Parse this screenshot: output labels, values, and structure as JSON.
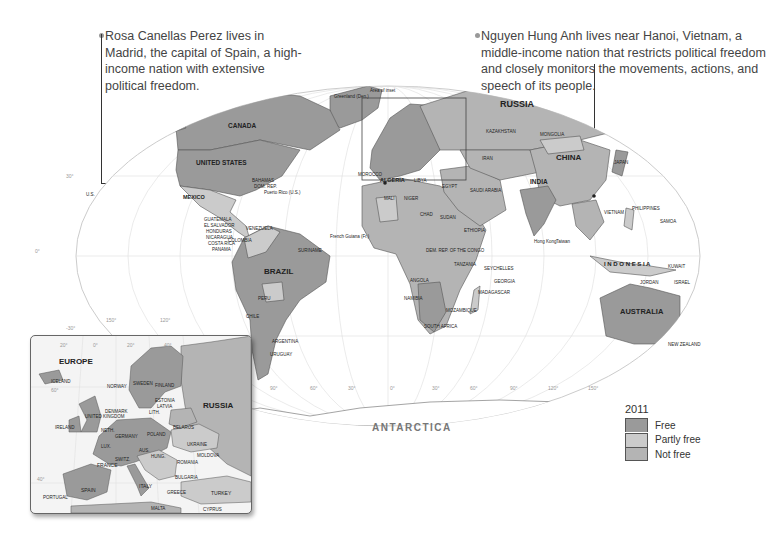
{
  "callouts": {
    "left": {
      "text": "Rosa Canellas Perez lives in Madrid, the capital of Spain, a high-income nation with extensive political freedom."
    },
    "right": {
      "text": "Nguyen Hung Anh lives near Hanoi, Vietnam, a middle-income nation that restricts political freedom and closely monitors the movements, actions, and speech of its people."
    }
  },
  "map": {
    "inset_area_label": "Area of inset",
    "continent_labels": {
      "antarctica": "ANTARCTICA"
    },
    "major_country_labels": {
      "canada": "CANADA",
      "united_states": "UNITED STATES",
      "russia": "RUSSIA",
      "china": "CHINA",
      "brazil": "BRAZIL",
      "australia": "AUSTRALIA",
      "india": "INDIA",
      "algeria": "ALGERIA",
      "mexico": "MEXICO",
      "argentina": "ARGENTINA",
      "mongolia": "MONGOLIA",
      "kazakhstan": "KAZAKHSTAN",
      "sudan": "SUDAN",
      "libya": "LIBYA",
      "egypt": "EGYPT",
      "chad": "CHAD",
      "niger": "NIGER",
      "mali": "MALI",
      "angola": "ANGOLA",
      "namibia": "NAMIBIA",
      "saudi_arabia": "SAUDI ARABIA",
      "iran": "IRAN",
      "indonesia": "I N D O N E S I A",
      "peru": "PERU",
      "bolivia": "BOLIVIA",
      "chile": "CHILE",
      "colombia": "COLOMBIA",
      "venezuela": "VENEZUELA",
      "madagascar": "MADAGASCAR",
      "philippines": "PHILIPPINES",
      "new_zealand": "NEW ZEALAND",
      "greenland": "Greenland (Den.)",
      "morocco": "MOROCCO",
      "ethiopia": "ETHIOPIA",
      "tanzania": "TANZANIA",
      "south_africa": "SOUTH AFRICA",
      "mozambique": "MOZAMBIQUE",
      "dem_rep_congo": "DEM. REP. OF THE CONGO",
      "japan": "JAPAN",
      "vietnam": "VIETNAM"
    },
    "small_labels": [
      "U.S.",
      "BAHAMAS",
      "DOM. REP.",
      "Puerto Rico (U.S.)",
      "CUBA",
      "BELIZE",
      "JAMAICA",
      "HAITI",
      "ST. KITTS & NEVIS",
      "ANTIGUA & BARBUDA",
      "DOMINICA",
      "ST. LUCIA",
      "BARBADOS",
      "ST. VINCENT & THE GRENADINES",
      "GRENADA",
      "TRINIDAD & TOBAGO",
      "GUYANA",
      "SURINAME",
      "French Guiana (Fr.)",
      "GUATEMALA",
      "EL SALVADOR",
      "HONDURAS",
      "NICARAGUA",
      "COSTA RICA",
      "PANAMA",
      "ECUADOR",
      "PARAGUAY",
      "URUGUAY",
      "Western Sahara (Mor.)",
      "MAURITANIA",
      "CAPE VERDE",
      "SENEGAL",
      "GAMBIA",
      "GUINEA-BISSAU",
      "GUINEA",
      "SIERRA LEONE",
      "LIBERIA",
      "COTE D'IVOIRE",
      "TOGO",
      "EQ. GUINEA",
      "SAO TOME & PRINCIPE",
      "REP. OF THE CONGO",
      "GHANA",
      "NIGERIA",
      "CAMEROON",
      "GABON",
      "C.A.R.",
      "ERITREA",
      "DJIBOUTI",
      "SOMALIA",
      "YEMEN",
      "OMAN",
      "UGANDA",
      "KENYA",
      "RWANDA",
      "BURUNDI",
      "MALAWI",
      "ZAMBIA",
      "ZIMBABWE",
      "BOTSWANA",
      "SWAZILAND",
      "LESOTHO",
      "COMOROS",
      "SEYCHELLES",
      "MAURITIUS",
      "GEORGIA",
      "ARMENIA",
      "AZERBAIJAN",
      "UZBEKISTAN",
      "TURKMENISTAN",
      "KYRGYZSTAN",
      "TAJIKISTAN",
      "AFGHANISTAN",
      "PAKISTAN",
      "NEPAL",
      "BHUTAN",
      "BANGLADESH",
      "MYANMAR",
      "LAOS",
      "THAILAND",
      "CAMBODIA",
      "MALAYSIA",
      "BRUNEI",
      "Singapore",
      "SRI LANKA",
      "MALDIVES",
      "NORTH KOREA",
      "SOUTH KOREA",
      "Taiwan",
      "Hong Kong",
      "Macau",
      "PALAU",
      "FEDERATED STATES OF MICRONESIA",
      "MARSHALL ISLANDS",
      "NAURU",
      "KIRIBATI",
      "TUVALU",
      "SOLOMON ISLANDS",
      "PAPUA NEW GUINEA",
      "TIMOR-LESTE",
      "VANUATU",
      "FIJI",
      "New Caledonia (Fr.)",
      "SAMOA",
      "TONGA",
      "IRAQ",
      "KUWAIT",
      "BAHRAIN",
      "QATAR",
      "U.A.E.",
      "JORDAN",
      "ISRAEL",
      "LEBANON",
      "SYRIA",
      "TUNISIA",
      "CYPRUS"
    ],
    "graticule": {
      "latitudes": [
        "30°",
        "0°",
        "-30°"
      ],
      "longitudes": [
        "150°",
        "120°",
        "90°",
        "60°",
        "30°",
        "0°",
        "30°",
        "60°",
        "90°",
        "120°",
        "150°"
      ]
    }
  },
  "inset": {
    "title": "EUROPE",
    "labels": {
      "russia": "RUSSIA",
      "iceland": "ICELAND",
      "norway": "NORWAY",
      "sweden": "SWEDEN",
      "finland": "FINLAND",
      "estonia": "ESTONIA",
      "latvia": "LATVIA",
      "lithuania": "LITH.",
      "denmark": "DENMARK",
      "united_kingdom": "UNITED KINGDOM",
      "ireland": "IRELAND",
      "neth": "NETH.",
      "bel": "BEL.",
      "lux": "LUX.",
      "germany": "GERMANY",
      "poland": "POLAND",
      "belarus": "BELARUS",
      "ukraine": "UKRAINE",
      "czech": "CZECH REP.",
      "slovakia": "SLOV.",
      "austria": "AUS.",
      "hungary": "HUNG.",
      "moldova": "MOLDOVA",
      "romania": "ROMANIA",
      "switz": "SWITZ.",
      "france": "FRANCE",
      "slovenia": "SLO.",
      "croatia": "CROATIA",
      "serbia": "SERBIA",
      "bulgaria": "BULGARIA",
      "italy": "ITALY",
      "alb": "ALB.",
      "greece": "GREECE",
      "spain": "SPAIN",
      "portugal": "PORTUGAL",
      "turkey": "TURKEY",
      "malta": "MALTA",
      "cyprus": "CYPRUS"
    },
    "graticule": {
      "longitudes": [
        "20°",
        "0°",
        "20°",
        "40°"
      ],
      "latitudes": [
        "60°",
        "40°"
      ]
    }
  },
  "legend": {
    "year": "2011",
    "items": [
      {
        "label": "Free",
        "color": "#9a9a9a"
      },
      {
        "label": "Partly free",
        "color": "#cbcbcb"
      },
      {
        "label": "Not free",
        "color": "#b4b4b4"
      }
    ]
  }
}
